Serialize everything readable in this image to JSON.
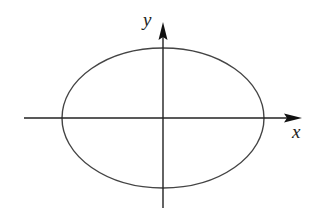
{
  "diagram": {
    "type": "ellipse-on-axes",
    "labels": {
      "x_axis": "x",
      "y_axis": "y"
    },
    "colors": {
      "stroke": "#222222",
      "ellipse_stroke": "#444444",
      "background": "#ffffff"
    },
    "geometry": {
      "origin": [
        163,
        118
      ],
      "ellipse_rx": 101,
      "ellipse_ry": 70,
      "x_axis_range_px": [
        24,
        302
      ],
      "y_axis_range_px": [
        22,
        208
      ]
    }
  }
}
